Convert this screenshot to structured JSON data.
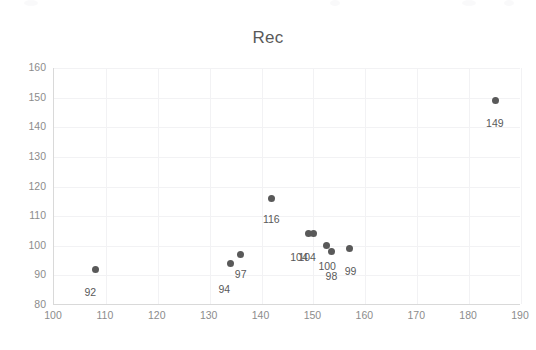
{
  "chart_data": {
    "type": "scatter",
    "title": "Rec",
    "xlabel": "",
    "ylabel": "",
    "xlim": [
      100,
      190
    ],
    "ylim": [
      80,
      160
    ],
    "xticks": [
      100,
      110,
      120,
      130,
      140,
      150,
      160,
      170,
      180,
      190
    ],
    "yticks": [
      80,
      90,
      100,
      110,
      120,
      130,
      140,
      150,
      160
    ],
    "grid": true,
    "legend": false,
    "marker_color": "#595959",
    "label_color": "#595959",
    "axis_color": "#8c8c8c",
    "grid_color": "#f2f2f4",
    "series": [
      {
        "name": "Rec",
        "points": [
          {
            "x": 108,
            "y": 92,
            "label": "92",
            "lx": -1,
            "ly": 17
          },
          {
            "x": 134,
            "y": 94,
            "label": "94",
            "lx": -2,
            "ly": 19
          },
          {
            "x": 136,
            "y": 97,
            "label": "97",
            "lx": 4,
            "ly": 13
          },
          {
            "x": 142,
            "y": 116,
            "label": "116",
            "lx": 1,
            "ly": 15
          },
          {
            "x": 149,
            "y": 104,
            "label": "104",
            "lx": -8,
            "ly": 17
          },
          {
            "x": 150,
            "y": 104,
            "label": "104",
            "lx": -5,
            "ly": 17
          },
          {
            "x": 152.5,
            "y": 100,
            "label": "100",
            "lx": 2,
            "ly": 14
          },
          {
            "x": 153.5,
            "y": 98,
            "label": "98",
            "lx": 4,
            "ly": 18
          },
          {
            "x": 157,
            "y": 99,
            "label": "99",
            "lx": 5,
            "ly": 16
          },
          {
            "x": 185,
            "y": 149,
            "label": "149",
            "lx": 1,
            "ly": 16
          }
        ]
      }
    ]
  }
}
